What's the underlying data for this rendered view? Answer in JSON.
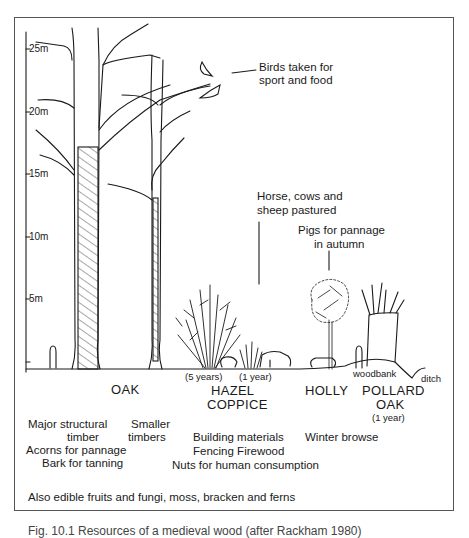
{
  "figure": {
    "type": "woodland-structure-illustration",
    "scale_axis": {
      "unit": "m",
      "ticks": [
        {
          "label": "25m",
          "value": 25
        },
        {
          "label": "20m",
          "value": 20
        },
        {
          "label": "15m",
          "value": 15
        },
        {
          "label": "10m",
          "value": 10
        },
        {
          "label": "5m",
          "value": 5
        }
      ]
    },
    "annotations": {
      "birds": "Birds taken for\nsport and food",
      "birds_line1": "Birds taken for",
      "birds_line2": "sport and food",
      "livestock_line1": "Horse, cows and",
      "livestock_line2": "sheep pastured",
      "pigs_line1": "Pigs for pannage",
      "pigs_line2": "in autumn",
      "woodbank": "woodbank",
      "ditch": "ditch"
    },
    "age_labels": {
      "hazel_5": "(5 years)",
      "hazel_1": "(1 year)",
      "pollard_1": "(1 year)"
    },
    "species": [
      {
        "id": "oak",
        "name": "OAK",
        "uses": [
          "Major structural",
          "timber",
          "Acorns for pannage",
          "Bark for tanning"
        ],
        "secondary_uses": [
          "Smaller",
          "timbers"
        ]
      },
      {
        "id": "hazel",
        "name_line1": "HAZEL",
        "name_line2": "COPPICE",
        "uses": [
          "Building materials",
          "Fencing  Firewood",
          "Nuts for human consumption"
        ]
      },
      {
        "id": "holly",
        "name": "HOLLY",
        "uses": [
          "Winter browse"
        ]
      },
      {
        "id": "pollard-oak",
        "name_line1": "POLLARD",
        "name_line2": "OAK"
      }
    ],
    "footer_note": "Also edible fruits and fungi, moss, bracken and ferns",
    "caption": "Fig. 10.1 Resources of a medieval wood (after Rackham 1980)"
  },
  "colors": {
    "ink": "#1a1a1a",
    "frame": "#555555",
    "background": "#ffffff"
  }
}
